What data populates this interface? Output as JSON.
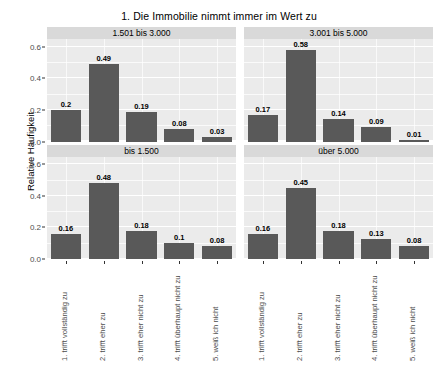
{
  "chart_data": {
    "type": "bar",
    "title": "1. Die Immobilie nimmt immer im Wert zu",
    "xlabel": "",
    "ylabel": "Relative Häufigkeit",
    "ylim": [
      0,
      0.65
    ],
    "yticks": [
      "0.0",
      "0.2",
      "0.4",
      "0.6"
    ],
    "ytick_values": [
      0.0,
      0.2,
      0.4,
      0.6
    ],
    "grid": true,
    "legend": "none",
    "categories": [
      "1. trifft vollständig zu",
      "2. trifft eher zu",
      "3. trifft eher nicht zu",
      "4. trifft überhaupt nicht zu",
      "5. weiß ich nicht"
    ],
    "facets": [
      {
        "label": "1.501 bis 3.000",
        "values": [
          0.2,
          0.49,
          0.19,
          0.08,
          0.03
        ],
        "labels": [
          "0.2",
          "0.49",
          "0.19",
          "0.08",
          "0.03"
        ]
      },
      {
        "label": "3.001 bis 5.000",
        "values": [
          0.17,
          0.58,
          0.14,
          0.09,
          0.01
        ],
        "labels": [
          "0.17",
          "0.58",
          "0.14",
          "0.09",
          "0.01"
        ]
      },
      {
        "label": "bis 1.500",
        "values": [
          0.16,
          0.48,
          0.18,
          0.1,
          0.08
        ],
        "labels": [
          "0.16",
          "0.48",
          "0.18",
          "0.1",
          "0.08"
        ]
      },
      {
        "label": "über 5.000",
        "values": [
          0.16,
          0.45,
          0.18,
          0.13,
          0.08
        ],
        "labels": [
          "0.16",
          "0.45",
          "0.18",
          "0.13",
          "0.08"
        ]
      }
    ],
    "colors": {
      "bar": "#595959",
      "panel_background": "#EBEBEB",
      "strip_background": "#D9D9D9",
      "gridline": "#FFFFFF",
      "text": "#000000",
      "tick_text": "#4D4D4D",
      "plot_background": "#FFFFFF"
    }
  }
}
